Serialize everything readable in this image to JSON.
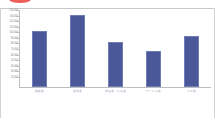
{
  "chart_data": {
    "type": "bar",
    "title": "",
    "subtitle": "",
    "xlabel": "",
    "ylabel": "",
    "grid": false,
    "legend": false,
    "legend_position": "none",
    "series_color": "#4a5899",
    "categories": [
      "建設業",
      "製造業",
      "卸売業・小売業",
      "サービス業",
      "その他"
    ],
    "values": [
      100000,
      130000,
      80000,
      65000,
      92000
    ],
    "ylim": [
      0,
      140000
    ],
    "ytick_labels": [
      "140,000",
      "130,000",
      "120,000",
      "110,000",
      "100,000",
      "90,000",
      "80,000",
      "70,000",
      "60,000",
      "50,000",
      "40,000",
      "30,000",
      "20,000"
    ],
    "ytick_values": [
      140000,
      130000,
      120000,
      110000,
      100000,
      90000,
      80000,
      70000,
      60000,
      50000,
      40000,
      30000,
      20000
    ]
  },
  "annotations": {
    "highlight_mark": "red-oval-highlight"
  },
  "colors": {
    "bar_fill": "#4a5899",
    "bar_stroke": "#6f7cb5",
    "axis": "#bdbdbd",
    "tick_text": "#8d8d8d",
    "category_text": "#9aa0bb",
    "frame": "#d2d2d2",
    "highlight": "#e8413c"
  }
}
